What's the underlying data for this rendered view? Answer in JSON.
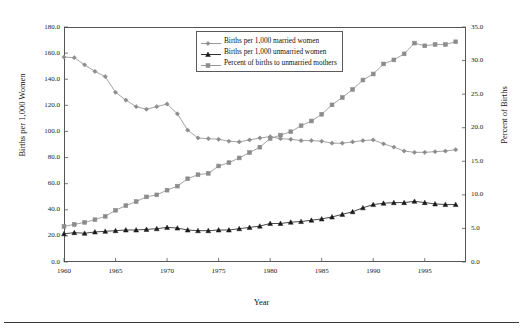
{
  "chart_data": {
    "type": "line",
    "title": "",
    "xlabel": "Year",
    "ylabel": "Births per 1,000 Women",
    "ylabel_right": "Percent of Births",
    "xlim": [
      1960,
      1999
    ],
    "ylim": [
      0,
      180
    ],
    "ylim_right": [
      0,
      35
    ],
    "grid": false,
    "legend_position": "top-center",
    "x_tick_labels": [
      "1960",
      "1965",
      "1970",
      "1975",
      "1980",
      "1985",
      "1990",
      "1995"
    ],
    "x_tick_values": [
      1960,
      1965,
      1970,
      1975,
      1980,
      1985,
      1990,
      1995
    ],
    "y_tick_labels": [
      "0.0",
      "20.0",
      "40.0",
      "60.0",
      "80.0",
      "100.0",
      "120.0",
      "140.0",
      "160.0",
      "180.0"
    ],
    "y_tick_values": [
      0,
      20,
      40,
      60,
      80,
      100,
      120,
      140,
      160,
      180
    ],
    "y_right_tick_labels": [
      "0.0",
      "5.0",
      "10.0",
      "15.0",
      "20.0",
      "25.0",
      "30.0",
      "35.0"
    ],
    "y_right_tick_values": [
      0,
      5,
      10,
      15,
      20,
      25,
      30,
      35
    ],
    "x": [
      1960,
      1961,
      1962,
      1963,
      1964,
      1965,
      1966,
      1967,
      1968,
      1969,
      1970,
      1971,
      1972,
      1973,
      1974,
      1975,
      1976,
      1977,
      1978,
      1979,
      1980,
      1981,
      1982,
      1983,
      1984,
      1985,
      1986,
      1987,
      1988,
      1989,
      1990,
      1991,
      1992,
      1993,
      1994,
      1995,
      1996,
      1997,
      1998
    ],
    "series": [
      {
        "name": "Births per 1,000 married women",
        "marker": "diamond",
        "color": "#8c8c8c",
        "axis": "left",
        "values": [
          157.0,
          156.5,
          151.0,
          146.0,
          142.0,
          130.0,
          124.0,
          119.0,
          117.0,
          119.0,
          121.0,
          113.5,
          101.0,
          95.0,
          94.5,
          94.0,
          92.5,
          92.0,
          93.5,
          95.0,
          96.0,
          94.5,
          94.0,
          93.0,
          93.0,
          92.5,
          91.0,
          91.0,
          92.0,
          93.0,
          93.5,
          90.5,
          88.0,
          85.0,
          84.0,
          84.0,
          84.5,
          85.0,
          86.0
        ]
      },
      {
        "name": "Births per 1,000 unmarried women",
        "marker": "triangle",
        "color": "#1a1a1a",
        "axis": "left",
        "values": [
          21.6,
          22.5,
          22.0,
          23.0,
          23.5,
          24.0,
          24.5,
          24.5,
          25.0,
          25.5,
          26.5,
          26.0,
          24.5,
          24.0,
          24.0,
          24.5,
          24.5,
          25.5,
          26.5,
          27.5,
          29.5,
          29.5,
          30.5,
          31.0,
          32.0,
          33.0,
          34.5,
          36.5,
          38.5,
          41.5,
          44.0,
          45.0,
          45.5,
          45.5,
          46.5,
          45.5,
          44.5,
          44.0,
          44.0
        ]
      },
      {
        "name": "Percent of births to unmarried mothers",
        "marker": "square",
        "color": "#8c8c8c",
        "axis": "right",
        "values": [
          5.3,
          5.6,
          5.9,
          6.3,
          6.8,
          7.7,
          8.4,
          9.0,
          9.7,
          10.0,
          10.7,
          11.3,
          12.4,
          13.0,
          13.2,
          14.3,
          14.8,
          15.5,
          16.3,
          17.1,
          18.4,
          18.9,
          19.4,
          20.3,
          21.0,
          22.0,
          23.4,
          24.5,
          25.7,
          27.1,
          28.0,
          29.5,
          30.1,
          31.0,
          32.6,
          32.2,
          32.4,
          32.4,
          32.8
        ]
      }
    ]
  },
  "legend": {
    "items": [
      {
        "label": "Births per 1,000 married women",
        "marker": "diamond",
        "color": "#8c8c8c"
      },
      {
        "label": "Births per 1,000 unmarried women",
        "marker": "triangle",
        "color": "#1a1a1a"
      },
      {
        "label": "Percent of births to unmarried mothers",
        "marker": "square",
        "color": "#8c8c8c"
      }
    ]
  }
}
